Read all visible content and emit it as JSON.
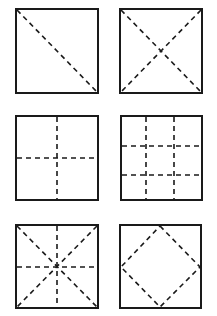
{
  "figure": {
    "stroke_color": "#1a1a1a",
    "background": "#ffffff",
    "panels": [
      {
        "id": "single-diagonal",
        "label": "One diagonal fold",
        "row": 0,
        "col": 0,
        "folds": [
          "diag-tl-br"
        ]
      },
      {
        "id": "both-diagonals",
        "label": "Two diagonal folds",
        "row": 0,
        "col": 1,
        "folds": [
          "diag-tl-br",
          "diag-tr-bl"
        ]
      },
      {
        "id": "half-cross",
        "label": "Horizontal and vertical center folds",
        "row": 1,
        "col": 0,
        "folds": [
          "vertical-mid",
          "horizontal-mid"
        ]
      },
      {
        "id": "thirds-grid",
        "label": "Thirds grid folds",
        "row": 1,
        "col": 1,
        "folds": [
          "vertical-third-1",
          "vertical-third-2",
          "horizontal-third-1",
          "horizontal-third-2"
        ]
      },
      {
        "id": "star-folds",
        "label": "Diagonal and center folds",
        "row": 2,
        "col": 0,
        "folds": [
          "diag-tl-br",
          "diag-tr-bl",
          "vertical-mid",
          "horizontal-mid"
        ]
      },
      {
        "id": "diamond-folds",
        "label": "Diamond (corner-to-center) folds",
        "row": 2,
        "col": 1,
        "folds": [
          "diamond"
        ]
      }
    ]
  }
}
